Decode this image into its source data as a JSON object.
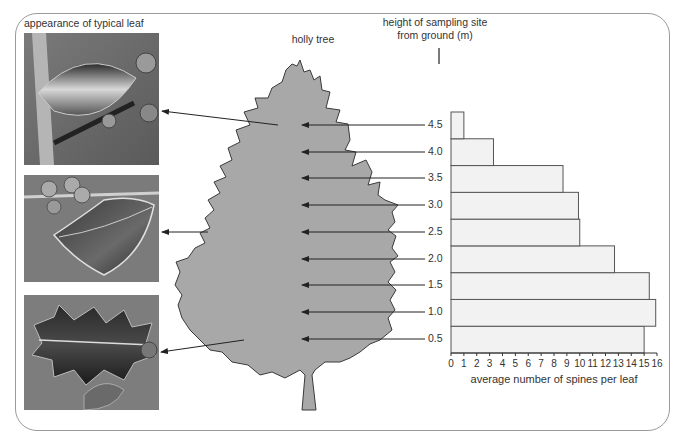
{
  "title_leaf": "appearance of typical leaf",
  "title_tree": "holly tree",
  "title_height_line1": "height of sampling site",
  "title_height_line2": "from ground (m)",
  "photos": [
    {
      "name": "leaf-photo-top",
      "description": "smooth holly leaf with few spines"
    },
    {
      "name": "leaf-photo-middle",
      "description": "wavy holly leaf with some spines"
    },
    {
      "name": "leaf-photo-bottom",
      "description": "very spiny holly leaf"
    }
  ],
  "colors": {
    "tree_fill": "#a8a8a8",
    "tree_outline": "#3a3a3a",
    "bar_fill": "#f2f2f2",
    "bar_outline": "#555555",
    "frame": "#9a9a9a"
  },
  "chart_data": {
    "type": "bar",
    "orientation": "horizontal",
    "title": "",
    "categories": [
      "0.5",
      "1.0",
      "1.5",
      "2.0",
      "2.5",
      "3.0",
      "3.5",
      "4.0",
      "4.5"
    ],
    "values": [
      15.0,
      15.9,
      15.4,
      12.7,
      10.0,
      9.9,
      8.7,
      3.3,
      1.0
    ],
    "xlabel": "average number of spines per leaf",
    "ylabel": "height of sampling site from ground (m)",
    "xlim": [
      0,
      16
    ],
    "xticks": [
      "0",
      "1",
      "2",
      "3",
      "4",
      "5",
      "6",
      "7",
      "8",
      "9",
      "10",
      "11",
      "12",
      "13",
      "14",
      "15",
      "16"
    ],
    "grid": false,
    "legend": null
  },
  "height_labels": [
    "4.5",
    "4.0",
    "3.5",
    "3.0",
    "2.5",
    "2.0",
    "1.5",
    "1.0",
    "0.5"
  ]
}
